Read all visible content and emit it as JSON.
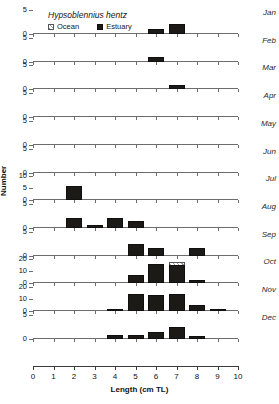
{
  "chart_data": {
    "type": "bar",
    "title": "Hypsoblennius hentz",
    "xlabel": "Length (cm TL)",
    "ylabel": "Number",
    "xlim": [
      0,
      10
    ],
    "xticks": [
      "0",
      "1",
      "2",
      "3",
      "4",
      "5",
      "6",
      "7",
      "8",
      "9",
      "10"
    ],
    "grid": false,
    "legend_position": "top-left",
    "legend": [
      {
        "name": "Ocean",
        "style": "hatched"
      },
      {
        "name": "Estuary",
        "style": "solid-black"
      }
    ],
    "panels": [
      {
        "label": "Jan",
        "ylim": [
          0,
          5
        ],
        "yticks": [
          "0",
          "5"
        ],
        "series": [
          {
            "name": "Ocean",
            "bars": []
          },
          {
            "name": "Estuary",
            "bars": [
              {
                "x": 6,
                "value": 1
              },
              {
                "x": 7,
                "value": 2
              }
            ]
          }
        ]
      },
      {
        "label": "Feb",
        "ylim": [
          0,
          5
        ],
        "yticks": [
          "0",
          "5"
        ],
        "series": [
          {
            "name": "Ocean",
            "bars": []
          },
          {
            "name": "Estuary",
            "bars": [
              {
                "x": 6,
                "value": 1
              }
            ]
          }
        ]
      },
      {
        "label": "Mar",
        "ylim": [
          0,
          5
        ],
        "yticks": [
          "0",
          "5"
        ],
        "series": [
          {
            "name": "Ocean",
            "bars": []
          },
          {
            "name": "Estuary",
            "bars": [
              {
                "x": 7,
                "value": 1
              }
            ]
          }
        ]
      },
      {
        "label": "Apr",
        "ylim": [
          0,
          5
        ],
        "yticks": [
          "0",
          "5"
        ],
        "series": [
          {
            "name": "Ocean",
            "bars": []
          },
          {
            "name": "Estuary",
            "bars": []
          }
        ]
      },
      {
        "label": "May",
        "ylim": [
          0,
          5
        ],
        "yticks": [
          "0",
          "5"
        ],
        "series": [
          {
            "name": "Ocean",
            "bars": []
          },
          {
            "name": "Estuary",
            "bars": []
          }
        ]
      },
      {
        "label": "Jun",
        "ylim": [
          0,
          5
        ],
        "yticks": [
          "0",
          "5"
        ],
        "series": [
          {
            "name": "Ocean",
            "bars": []
          },
          {
            "name": "Estuary",
            "bars": []
          }
        ]
      },
      {
        "label": "Jul",
        "ylim": [
          0,
          10
        ],
        "yticks": [
          "0",
          "5",
          "10"
        ],
        "series": [
          {
            "name": "Ocean",
            "bars": []
          },
          {
            "name": "Estuary",
            "bars": [
              {
                "x": 2,
                "value": 6
              }
            ]
          }
        ]
      },
      {
        "label": "Aug",
        "ylim": [
          0,
          5
        ],
        "yticks": [
          "0",
          "5"
        ],
        "series": [
          {
            "name": "Ocean",
            "bars": []
          },
          {
            "name": "Estuary",
            "bars": [
              {
                "x": 2,
                "value": 2
              },
              {
                "x": 3,
                "value": 0.6
              },
              {
                "x": 4,
                "value": 2
              },
              {
                "x": 5,
                "value": 1.4
              }
            ]
          }
        ]
      },
      {
        "label": "Sep",
        "ylim": [
          0,
          5
        ],
        "yticks": [
          "0",
          "5"
        ],
        "series": [
          {
            "name": "Ocean",
            "bars": []
          },
          {
            "name": "Estuary",
            "bars": [
              {
                "x": 5,
                "value": 2.4
              },
              {
                "x": 6,
                "value": 1.6
              },
              {
                "x": 8,
                "value": 1.6
              }
            ]
          }
        ]
      },
      {
        "label": "Oct",
        "ylim": [
          0,
          20
        ],
        "yticks": [
          "0",
          "10",
          "20"
        ],
        "series": [
          {
            "name": "Ocean",
            "bars": [
              {
                "x": 7,
                "value": 18
              }
            ]
          },
          {
            "name": "Estuary",
            "bars": [
              {
                "x": 5,
                "value": 7
              },
              {
                "x": 6,
                "value": 16
              },
              {
                "x": 7,
                "value": 15
              },
              {
                "x": 8,
                "value": 3
              }
            ]
          }
        ]
      },
      {
        "label": "Nov",
        "ylim": [
          0,
          20
        ],
        "yticks": [
          "0",
          "10",
          "20"
        ],
        "series": [
          {
            "name": "Ocean",
            "bars": []
          },
          {
            "name": "Estuary",
            "bars": [
              {
                "x": 4,
                "value": 1
              },
              {
                "x": 5,
                "value": 14
              },
              {
                "x": 6,
                "value": 13
              },
              {
                "x": 7,
                "value": 14
              },
              {
                "x": 8,
                "value": 5
              },
              {
                "x": 9,
                "value": 2
              }
            ]
          }
        ]
      },
      {
        "label": "Dec",
        "ylim": [
          0,
          5
        ],
        "yticks": [
          "0",
          "5"
        ],
        "series": [
          {
            "name": "Ocean",
            "bars": []
          },
          {
            "name": "Estuary",
            "bars": [
              {
                "x": 4,
                "value": 0.7
              },
              {
                "x": 5,
                "value": 0.7
              },
              {
                "x": 6,
                "value": 1.5
              },
              {
                "x": 7,
                "value": 2.4
              },
              {
                "x": 8,
                "value": 0.6
              }
            ]
          }
        ]
      }
    ]
  }
}
